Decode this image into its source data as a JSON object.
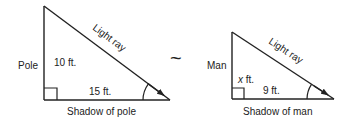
{
  "diagram": {
    "type": "similar-triangles",
    "similarity_symbol": "~",
    "stroke_color": "#222222",
    "background_color": "#ffffff",
    "left_triangle": {
      "name": "pole-triangle",
      "vertical_label": "Pole",
      "height_label": "10 ft.",
      "base_value_label": "15 ft.",
      "base_label": "Shadow of pole",
      "hypotenuse_label": "Light ray",
      "height_ft": 10,
      "base_ft": 15
    },
    "right_triangle": {
      "name": "man-triangle",
      "vertical_label": "Man",
      "height_var": "x",
      "height_unit": " ft.",
      "base_value_label": "9 ft.",
      "base_label": "Shadow of man",
      "hypotenuse_label": "Light ray",
      "height_ft": "x",
      "base_ft": 9
    }
  }
}
